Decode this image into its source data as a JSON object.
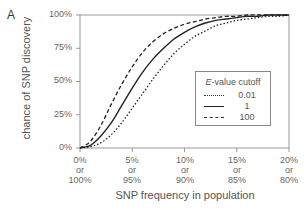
{
  "panel_label": "A",
  "chart_data": {
    "type": "line",
    "title": "",
    "xlabel": "SNP frequency in population",
    "ylabel": "chance of  SNP discovery",
    "x_ticks": [
      "0%\nor\n100%",
      "5%\nor\n95%",
      "10%\nor\n90%",
      "15%\nor\n85%",
      "20%\nor\n80%"
    ],
    "x_tick_lines": [
      [
        "0%",
        "or",
        "100%"
      ],
      [
        "5%",
        "or",
        "95%"
      ],
      [
        "10%",
        "or",
        "90%"
      ],
      [
        "15%",
        "or",
        "85%"
      ],
      [
        "20%",
        "or",
        "80%"
      ]
    ],
    "y_ticks": [
      "0%",
      "25%",
      "50%",
      "75%",
      "100%"
    ],
    "xlim": [
      0,
      20
    ],
    "ylim": [
      0,
      100
    ],
    "grid": false,
    "legend_position": "center-right",
    "legend_title_italic": "E",
    "legend_title_rest": "-value cutoff",
    "x": [
      0,
      1,
      2,
      3,
      4,
      5,
      6,
      7,
      8,
      9,
      10,
      11,
      12,
      13,
      14,
      15,
      16,
      17,
      18,
      19,
      20
    ],
    "series": [
      {
        "name": "0.01",
        "style": "dotted",
        "values": [
          0,
          1,
          4,
          10,
          19,
          30,
          41,
          52,
          62,
          71,
          78,
          84,
          88,
          92,
          94,
          96,
          97,
          98,
          99,
          99,
          100
        ]
      },
      {
        "name": "1",
        "style": "solid",
        "values": [
          0,
          2,
          9,
          19,
          32,
          45,
          57,
          67,
          75,
          82,
          87,
          91,
          94,
          96,
          97,
          98,
          99,
          99,
          100,
          100,
          100
        ]
      },
      {
        "name": "100",
        "style": "dashed",
        "values": [
          0,
          5,
          17,
          33,
          48,
          61,
          72,
          80,
          86,
          90,
          93,
          95,
          97,
          98,
          99,
          99,
          100,
          100,
          100,
          100,
          100
        ]
      }
    ]
  }
}
